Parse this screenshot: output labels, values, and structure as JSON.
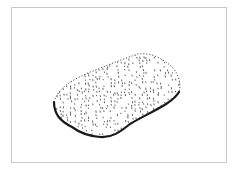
{
  "figure": {
    "ink_color": "#1a1a1a",
    "frame_color": "#c8c8c8",
    "background_color": "#ffffff"
  }
}
